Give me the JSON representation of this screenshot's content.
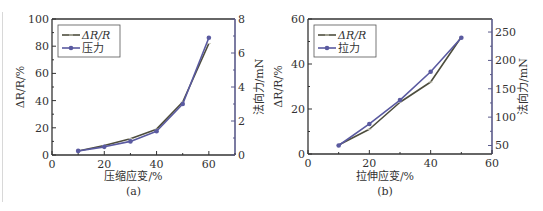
{
  "colors": {
    "resistance_line": "#4d4d3d",
    "force_line": "#5a5aa0",
    "axis": "#333333",
    "right_axis": "#5a5a8a"
  },
  "chart_data": [
    {
      "type": "line",
      "panel": "(a)",
      "caption": "(a)",
      "xlabel": "压缩应变/%",
      "ylabel": "ΔR/R/%",
      "y2label": "法向力/mN",
      "xlim": [
        0,
        70
      ],
      "ylim": [
        0,
        100
      ],
      "y2lim": [
        0,
        8
      ],
      "xticks": [
        "0",
        "20",
        "40",
        "60"
      ],
      "yticks": [
        "0",
        "20",
        "40",
        "60",
        "80",
        "100"
      ],
      "y2ticks": [
        "0",
        "2",
        "4",
        "6",
        "8"
      ],
      "legend": [
        "ΔR/R",
        "压力"
      ],
      "legend_position": "upper left",
      "x": [
        10,
        20,
        30,
        40,
        50,
        60
      ],
      "series": [
        {
          "name": "ΔR/R",
          "axis": "left",
          "values": [
            3,
            7,
            12,
            19,
            39,
            82
          ]
        },
        {
          "name": "压力",
          "axis": "right",
          "values": [
            0.24,
            0.48,
            0.8,
            1.4,
            3.0,
            6.9
          ]
        }
      ]
    },
    {
      "type": "line",
      "panel": "(b)",
      "caption": "(b)",
      "xlabel": "拉伸应变/%",
      "ylabel": "ΔR/R/%",
      "y2label": "法向力/mN",
      "xlim": [
        0,
        60
      ],
      "ylim": [
        0,
        60
      ],
      "y2lim": [
        35,
        273
      ],
      "xticks": [
        "0",
        "20",
        "40",
        "60"
      ],
      "yticks": [
        "0",
        "20",
        "40",
        "60"
      ],
      "y2ticks": [
        "50",
        "100",
        "150",
        "200",
        "250"
      ],
      "legend": [
        "ΔR/R",
        "拉力"
      ],
      "legend_position": "upper left",
      "x": [
        10,
        20,
        30,
        40,
        50
      ],
      "series": [
        {
          "name": "ΔR/R",
          "axis": "left",
          "values": [
            4,
            11,
            23,
            32,
            52
          ]
        },
        {
          "name": "拉力",
          "axis": "right",
          "values": [
            50,
            88,
            130,
            180,
            240
          ]
        }
      ]
    }
  ]
}
